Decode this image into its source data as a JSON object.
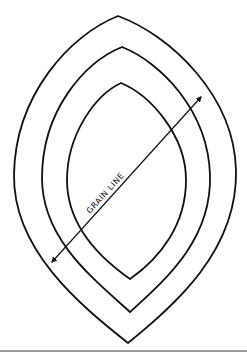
{
  "diagram": {
    "label": "GRAIN LINE",
    "colors": {
      "stroke": "#111111",
      "background": "#ffffff",
      "rule": "#9a9a9a"
    },
    "shapes": [
      {
        "name": "outer-outline",
        "top": [
          118,
          16
        ],
        "bottom": [
          128,
          343
        ]
      },
      {
        "name": "middle-outline",
        "top": [
          122,
          47
        ],
        "bottom": [
          130,
          312
        ]
      },
      {
        "name": "inner-outline",
        "top": [
          121,
          83
        ],
        "bottom": [
          130,
          279
        ]
      }
    ],
    "arrow": {
      "start": [
        52,
        262
      ],
      "end": [
        201,
        97
      ],
      "double_headed": true
    }
  }
}
